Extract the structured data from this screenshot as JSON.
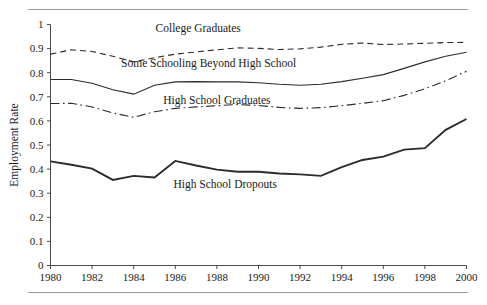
{
  "figure": {
    "top_rule": "horizontal-rule",
    "bottom_rule": "horizontal-rule"
  },
  "chart_data": {
    "type": "line",
    "title": "",
    "xlabel": "",
    "ylabel": "Employment Rate",
    "xlim": [
      1980,
      2000
    ],
    "ylim": [
      0,
      1
    ],
    "grid": false,
    "legend": "inline-annotations",
    "xticks": [
      1980,
      1982,
      1984,
      1986,
      1988,
      1990,
      1992,
      1994,
      1996,
      1998,
      2000
    ],
    "xticklabels": [
      "1980",
      "1982",
      "1984",
      "1986",
      "1988",
      "1990",
      "1992",
      "1994",
      "1996",
      "1998",
      "2000"
    ],
    "yticks": [
      0,
      0.1,
      0.2,
      0.3,
      0.4,
      0.5,
      0.6,
      0.7,
      0.8,
      0.9,
      1
    ],
    "yticklabels": [
      "0",
      "0.1",
      "0.2",
      "0.3",
      "0.4",
      "0.5",
      "0.6",
      "0.7",
      "0.8",
      "0.9",
      "1"
    ],
    "x": [
      1980,
      1981,
      1982,
      1983,
      1984,
      1985,
      1986,
      1987,
      1988,
      1989,
      1990,
      1991,
      1992,
      1993,
      1994,
      1995,
      1996,
      1997,
      1998,
      1999,
      2000
    ],
    "series": [
      {
        "name": "College Graduates",
        "style": "dashed",
        "label_x": 1987.1,
        "label_y": 0.968,
        "values": [
          0.877,
          0.895,
          0.888,
          0.868,
          0.845,
          0.862,
          0.877,
          0.886,
          0.895,
          0.903,
          0.901,
          0.896,
          0.899,
          0.906,
          0.918,
          0.923,
          0.917,
          0.919,
          0.922,
          0.925,
          0.926
        ]
      },
      {
        "name": "Some Schooling Beyond High School",
        "style": "solid",
        "label_x": 1987.6,
        "label_y": 0.822,
        "values": [
          0.772,
          0.772,
          0.756,
          0.729,
          0.711,
          0.748,
          0.762,
          0.763,
          0.762,
          0.762,
          0.758,
          0.752,
          0.748,
          0.752,
          0.763,
          0.777,
          0.792,
          0.818,
          0.845,
          0.868,
          0.885
        ]
      },
      {
        "name": "High School Graduates",
        "style": "dash-dot",
        "label_x": 1988.0,
        "label_y": 0.672,
        "values": [
          0.672,
          0.673,
          0.658,
          0.633,
          0.615,
          0.638,
          0.652,
          0.658,
          0.663,
          0.668,
          0.664,
          0.656,
          0.652,
          0.655,
          0.663,
          0.673,
          0.684,
          0.706,
          0.733,
          0.766,
          0.806
        ]
      },
      {
        "name": "High School Dropouts",
        "style": "solid-bold",
        "label_x": 1988.4,
        "label_y": 0.322,
        "values": [
          0.432,
          0.418,
          0.402,
          0.355,
          0.372,
          0.365,
          0.434,
          0.415,
          0.398,
          0.389,
          0.389,
          0.382,
          0.378,
          0.372,
          0.408,
          0.438,
          0.452,
          0.481,
          0.487,
          0.563,
          0.608
        ]
      }
    ]
  }
}
